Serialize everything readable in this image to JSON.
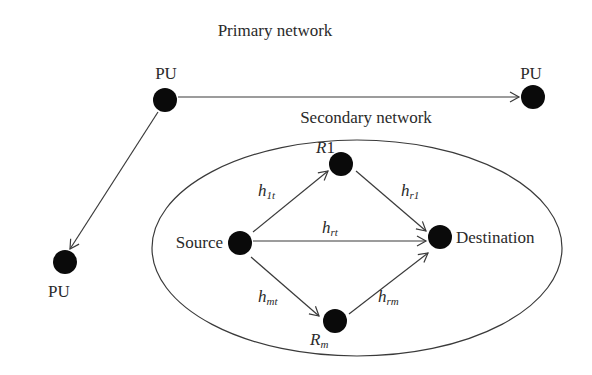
{
  "title": "Primary network",
  "secondary_title": "Secondary network",
  "colors": {
    "node": "#0a0a0a",
    "edge": "#3a3a3a",
    "text": "#2a2a2a",
    "background": "#ffffff"
  },
  "nodes": {
    "pu_top": {
      "label": "PU"
    },
    "pu_right": {
      "label": "PU"
    },
    "pu_bottom": {
      "label": "PU"
    },
    "source": {
      "label": "Source"
    },
    "destination": {
      "label": "Destination"
    },
    "r1": {
      "label_main": "R",
      "label_sub": "1"
    },
    "rm": {
      "label_main": "R",
      "label_sub": "m"
    }
  },
  "edges": {
    "h1t": {
      "main": "h",
      "sub": "1t",
      "from": "Source",
      "to": "R1"
    },
    "hr1": {
      "main": "h",
      "sub": "r1",
      "from": "R1",
      "to": "Destination"
    },
    "hrt": {
      "main": "h",
      "sub": "rt",
      "from": "Source",
      "to": "Destination"
    },
    "hmt": {
      "main": "h",
      "sub": "mt",
      "from": "Source",
      "to": "Rm"
    },
    "hrm": {
      "main": "h",
      "sub": "rm",
      "from": "Rm",
      "to": "Destination"
    },
    "pu_link_right": {
      "from": "PU (top)",
      "to": "PU (right)"
    },
    "pu_link_bottom": {
      "from": "PU (top)",
      "to": "PU (bottom)"
    }
  }
}
